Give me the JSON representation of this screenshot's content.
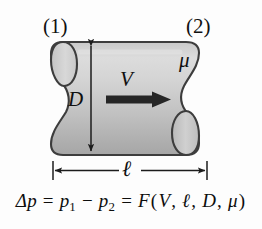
{
  "figure": {
    "type": "pipe-flow-schematic",
    "background_color": "#fdfdfd",
    "pipe_fill_light": "#d2d2d2",
    "pipe_fill_dark": "#a8a8a8",
    "outline_color": "#3a3a3a",
    "annotation_color": "#101010",
    "labels": {
      "station_inlet": "(1)",
      "station_outlet": "(2)",
      "viscosity": "μ",
      "diameter": "D",
      "velocity": "V",
      "length": "ℓ"
    },
    "dimensions": {
      "diameter_label": "D",
      "diameter_orientation": "vertical-double-arrow",
      "length_label": "ℓ",
      "length_orientation": "horizontal-double-arrow"
    },
    "flow": {
      "arrow_label": "V",
      "arrow_direction": "right"
    }
  },
  "equation": {
    "delta": "Δ",
    "p": "p",
    "equals": "=",
    "minus": "−",
    "sub1": "1",
    "sub2": "2",
    "function_name": "F",
    "open_paren": "(",
    "close_paren": ")",
    "comma": ",",
    "arg_velocity": "V",
    "arg_length": "ℓ",
    "arg_diameter": "D",
    "arg_viscosity": "μ",
    "plain_text": "Δp = p₁ − p₂ = F(V, ℓ, D, μ)"
  }
}
